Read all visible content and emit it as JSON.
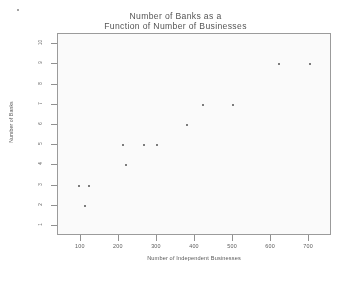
{
  "chart_data": {
    "type": "scatter",
    "title": "Number of Banks as a Function of Number of Businesses",
    "title_line1": "Number of Banks as a",
    "title_line2": "Function of Number of Businesses",
    "xlabel": "Number of Independent Businesses",
    "ylabel": "Number of Banks",
    "xlim": [
      40,
      760
    ],
    "ylim": [
      0.5,
      10.5
    ],
    "grid": false,
    "legend": null,
    "xticks": [
      100,
      200,
      300,
      400,
      500,
      600,
      700
    ],
    "xtick_labels": [
      "100",
      "200",
      "300",
      "400",
      "500",
      "600",
      "700"
    ],
    "yticks": [
      1,
      2,
      3,
      4,
      5,
      6,
      7,
      8,
      9,
      10
    ],
    "ytick_labels": [
      "1",
      "2",
      "3",
      "4",
      "5",
      "6",
      "7",
      "8",
      "9",
      "10"
    ],
    "marker": "point",
    "marker_color": "#4c4c4c",
    "points": [
      {
        "x": 95,
        "y": 3
      },
      {
        "x": 122,
        "y": 3
      },
      {
        "x": 112,
        "y": 2
      },
      {
        "x": 212,
        "y": 5
      },
      {
        "x": 218,
        "y": 4
      },
      {
        "x": 265,
        "y": 5
      },
      {
        "x": 300,
        "y": 5
      },
      {
        "x": 378,
        "y": 6
      },
      {
        "x": 422,
        "y": 7
      },
      {
        "x": 500,
        "y": 7
      },
      {
        "x": 622,
        "y": 9
      },
      {
        "x": 702,
        "y": 9
      }
    ],
    "x_values": [
      95,
      122,
      112,
      212,
      218,
      265,
      300,
      378,
      422,
      500,
      622,
      702
    ],
    "y_values": [
      3,
      3,
      2,
      5,
      4,
      5,
      5,
      6,
      7,
      7,
      9,
      9
    ],
    "n_points": 12,
    "frame_color": "#9a9a9a",
    "background": "#ffffff"
  }
}
